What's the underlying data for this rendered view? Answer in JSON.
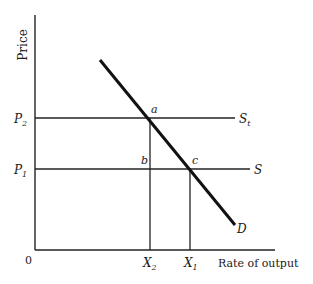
{
  "diagram": {
    "y_axis_label": "Price",
    "x_axis_label": "Rate of output",
    "origin_label": "0",
    "price_labels": {
      "p2": "P",
      "p2_sub": "2",
      "p1": "P",
      "p1_sub": "1"
    },
    "quantity_labels": {
      "x2": "X",
      "x2_sub": "2",
      "x1": "X",
      "x1_sub": "1"
    },
    "curves": {
      "demand": "D",
      "supply_taxed": "S",
      "supply_taxed_sub": "t",
      "supply": "S"
    },
    "points": {
      "a": "a",
      "b": "b",
      "c": "c"
    }
  }
}
